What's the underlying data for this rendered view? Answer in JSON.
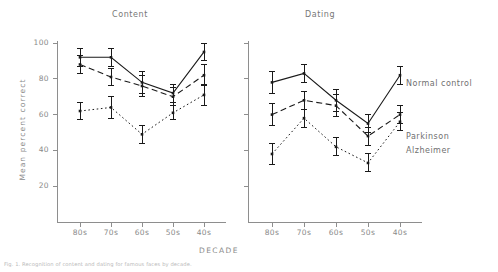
{
  "chart_data": {
    "type": "line",
    "title": "",
    "panels": [
      {
        "title": "Content",
        "xlabel": "",
        "ylabel": "Mean percent correct",
        "categories": [
          "80s",
          "70s",
          "60s",
          "50s",
          "40s"
        ],
        "ylim": [
          0,
          105
        ],
        "yticks": [
          20,
          40,
          60,
          80,
          100
        ],
        "series": [
          {
            "name": "Normal control",
            "style": "solid",
            "values": [
              92,
              92,
              78,
              72,
              95
            ],
            "errors": [
              5,
              5,
              6,
              5,
              5
            ]
          },
          {
            "name": "Parkinson",
            "style": "dashed",
            "values": [
              88,
              81,
              76,
              70,
              82
            ],
            "errors": [
              5,
              5,
              6,
              5,
              6
            ]
          },
          {
            "name": "Alzheimer",
            "style": "dotted",
            "values": [
              62,
              64,
              49,
              61,
              71
            ],
            "errors": [
              5,
              6,
              5,
              4,
              6
            ]
          }
        ]
      },
      {
        "title": "Dating",
        "xlabel": "",
        "ylabel": "",
        "categories": [
          "80s",
          "70s",
          "60s",
          "50s",
          "40s"
        ],
        "ylim": [
          0,
          105
        ],
        "yticks": [
          20,
          40,
          60,
          80,
          100
        ],
        "series": [
          {
            "name": "Normal control",
            "style": "solid",
            "values": [
              78,
              83,
              68,
              55,
              82
            ],
            "errors": [
              6,
              5,
              6,
              5,
              5
            ]
          },
          {
            "name": "Parkinson",
            "style": "dashed",
            "values": [
              60,
              68,
              65,
              48,
              60
            ],
            "errors": [
              6,
              5,
              6,
              5,
              5
            ]
          },
          {
            "name": "Alzheimer",
            "style": "dotted",
            "values": [
              38,
              58,
              42,
              33,
              56
            ],
            "errors": [
              6,
              5,
              5,
              5,
              5
            ]
          }
        ]
      }
    ],
    "shared_xlabel": "DECADE",
    "legend": [
      "Normal control",
      "Parkinson",
      "Alzheimer"
    ],
    "legend_position": "right",
    "grid": false
  },
  "axes": {
    "ylabel": "Mean percent correct",
    "xlabel": "DECADE",
    "ytick_labels": [
      "100",
      "80",
      "60",
      "40",
      "20"
    ],
    "xtick_labels_left": [
      "80s",
      "70s",
      "60s",
      "50s",
      "40s"
    ],
    "xtick_labels_right": [
      "80s",
      "70s",
      "60s",
      "50s",
      "40s"
    ]
  },
  "titles": {
    "left_panel": "Content",
    "right_panel": "Dating"
  },
  "legend": {
    "normal": "Normal control",
    "parkinson": "Parkinson",
    "alzheimer": "Alzheimer"
  },
  "caption": "Fig. 1. Recognition of content and dating for famous faces by decade.",
  "colors": {
    "line": "#1a1a1a",
    "axis": "#8e8e8e",
    "text": "#8a8a8a",
    "background": "#ffffff"
  }
}
